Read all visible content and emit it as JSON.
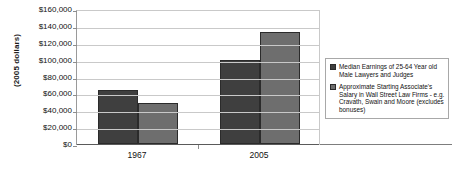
{
  "chart_data": {
    "type": "bar",
    "title": "",
    "xlabel": "",
    "ylabel": "(2005 dollars)",
    "categories": [
      "1967",
      "2005"
    ],
    "series": [
      {
        "name": "Median Earnings of 25-64 Year old Male Lawyers and Judges",
        "color": "#3f3f3f",
        "values": [
          64000,
          99000
        ]
      },
      {
        "name": "Approximate Starting Associate's Salary in Wall Street Law Firms - e.g. Cravath, Swain and Moore (excludes bonuses)",
        "color": "#6e6e6e",
        "values": [
          49000,
          133000
        ]
      }
    ],
    "ylim": [
      0,
      160000
    ],
    "ytick_values": [
      0,
      20000,
      40000,
      60000,
      80000,
      100000,
      120000,
      140000,
      160000
    ],
    "ytick_labels": [
      "$0",
      "$20,000",
      "$40,000",
      "$60,000",
      "$80,000",
      "$100,000",
      "$120,000",
      "$140,000",
      "$160,000"
    ],
    "grid": true,
    "legend_position": "right"
  },
  "legend": {
    "entries": [
      {
        "label": "Median Earnings of 25-64 Year old Male Lawyers and Judges"
      },
      {
        "label": "Approximate Starting Associate's Salary in Wall Street Law Firms - e.g. Cravath, Swain and Moore (excludes bonuses)"
      }
    ]
  },
  "colors": {
    "series_1": "#3f3f3f",
    "series_2": "#6e6e6e",
    "gridline": "#c9c9c9",
    "axis": "#5a5a5a",
    "background": "#ffffff"
  }
}
